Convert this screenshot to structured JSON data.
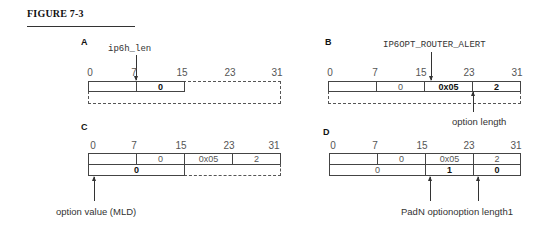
{
  "figure": {
    "title": "FIGURE 7-3"
  },
  "bit_labels": [
    "0",
    "7",
    "15",
    "23",
    "31"
  ],
  "panels": {
    "A": {
      "label": "A",
      "pointer_label": "ip6h_len",
      "row1": [
        "",
        "0"
      ],
      "row1_bold": [
        false,
        true
      ]
    },
    "B": {
      "label": "B",
      "pointer_label": "IP6OPT_ROUTER_ALERT",
      "row1": [
        "",
        "0",
        "0x05",
        "2"
      ],
      "row1_bold": [
        false,
        false,
        true,
        true
      ],
      "bottom_note": "option length"
    },
    "C": {
      "label": "C",
      "row1": [
        "",
        "0",
        "0x05",
        "2"
      ],
      "row2": [
        "0"
      ],
      "row2_bold": [
        true
      ],
      "bottom_note": "option value (MLD)"
    },
    "D": {
      "label": "D",
      "row1": [
        "",
        "0",
        "0x05",
        "2"
      ],
      "row2": [
        "0",
        "1",
        "0"
      ],
      "row2_bold": [
        false,
        true,
        true
      ],
      "bottom_note": "PadN optionoption length1"
    }
  }
}
